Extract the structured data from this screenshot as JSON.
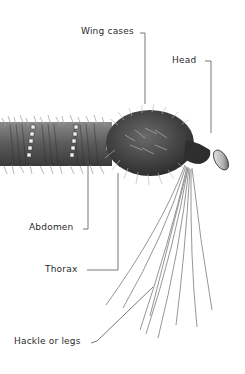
{
  "diagram": {
    "labels": {
      "wing_cases": "Wing cases",
      "head": "Head",
      "abdomen": "Abdomen",
      "thorax": "Thorax",
      "hackle": "Hackle or legs"
    },
    "colors": {
      "background": "#ffffff",
      "text": "#2a2a2a",
      "leader_line": "#555555",
      "body_dark": "#3a3a3a",
      "body_mid": "#6e6e6e",
      "rib_light": "#e8e8e8"
    }
  }
}
